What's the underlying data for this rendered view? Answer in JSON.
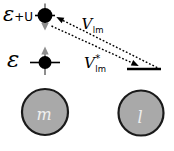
{
  "figure": {
    "levels": {
      "upper": {
        "epsilon": "ε",
        "rest": "+U"
      },
      "lower": {
        "epsilon": "ε"
      }
    },
    "couplings": {
      "v": {
        "symbol": "V",
        "subscript": "lm"
      },
      "v_star": {
        "symbol": "V",
        "superscript": "*",
        "subscript": "lm"
      }
    },
    "sites": {
      "left": "m",
      "right": "l"
    },
    "colors": {
      "ink": "#000000",
      "spin_arrow": "#8e8e8e",
      "site_fill": "#a9a9a9",
      "site_stroke": "#1a1a1a",
      "site_label": "#efefef",
      "background": "#ffffff"
    }
  }
}
